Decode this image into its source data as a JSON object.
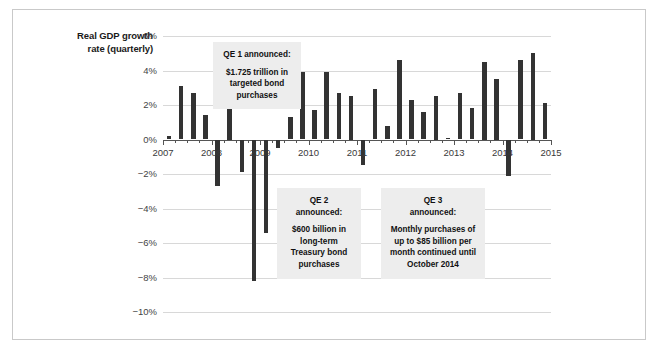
{
  "figure": {
    "axis_title_line1": "Real GDP growth",
    "axis_title_line2": "rate (quarterly)",
    "bar_color": "#333333",
    "callout_bg": "#ededed",
    "grid_color": "#d8d8d8",
    "zero_line_color": "#555555",
    "frame_color": "#c9c9c9"
  },
  "callouts": {
    "qe1": {
      "header": "QE 1 announced:",
      "body_line1": "$1.725 trillion in",
      "body_line2": "targeted bond",
      "body_line3": "purchases"
    },
    "qe2": {
      "header_line1": "QE 2",
      "header_line2": "announced:",
      "body_line1": "$600 billion in",
      "body_line2": "long-term",
      "body_line3": "Treasury bond",
      "body_line4": "purchases"
    },
    "qe3": {
      "header_line1": "QE 3",
      "header_line2": "announced:",
      "body_line1": "Monthly purchases of",
      "body_line2": "up to $85 billion per",
      "body_line3": "month continued until",
      "body_line4": "October 2014"
    }
  },
  "chart_data": {
    "type": "bar",
    "title": "",
    "xlabel": "",
    "ylabel": "Real GDP growth rate (quarterly)",
    "ylim": [
      -10,
      6
    ],
    "ytick_labels": [
      "6%",
      "4%",
      "2%",
      "0%",
      "−2%",
      "−4%",
      "−6%",
      "−8%",
      "−10%"
    ],
    "ytick_values": [
      6,
      4,
      2,
      0,
      -2,
      -4,
      -6,
      -8,
      -10
    ],
    "xtick_labels": [
      "2007",
      "2008",
      "2009",
      "2010",
      "2011",
      "2012",
      "2013",
      "2014",
      "2015"
    ],
    "xtick_values": [
      2007,
      2008,
      2009,
      2010,
      2011,
      2012,
      2013,
      2014,
      2015
    ],
    "grid": true,
    "legend": "none",
    "x": [
      "2007 Q1",
      "2007 Q2",
      "2007 Q3",
      "2007 Q4",
      "2008 Q1",
      "2008 Q2",
      "2008 Q3",
      "2008 Q4",
      "2009 Q1",
      "2009 Q2",
      "2009 Q3",
      "2009 Q4",
      "2010 Q1",
      "2010 Q2",
      "2010 Q3",
      "2010 Q4",
      "2011 Q1",
      "2011 Q2",
      "2011 Q3",
      "2011 Q4",
      "2012 Q1",
      "2012 Q2",
      "2012 Q3",
      "2012 Q4",
      "2013 Q1",
      "2013 Q2",
      "2013 Q3",
      "2013 Q4",
      "2014 Q1",
      "2014 Q2",
      "2014 Q3",
      "2014 Q4"
    ],
    "values": [
      0.2,
      3.1,
      2.7,
      1.4,
      -2.7,
      2.0,
      -1.9,
      -8.2,
      -5.4,
      -0.5,
      1.3,
      3.9,
      1.7,
      3.9,
      2.7,
      2.5,
      -1.5,
      2.9,
      0.8,
      4.6,
      2.3,
      1.6,
      2.5,
      0.1,
      2.7,
      1.8,
      4.5,
      3.5,
      -2.1,
      4.6,
      5.0,
      2.1
    ],
    "annotations": [
      "QE 1 announced: $1.725 trillion in targeted bond purchases",
      "QE 2 announced: $600 billion in long-term Treasury bond purchases",
      "QE 3 announced: Monthly purchases of up to $85 billion per month continued until October 2014"
    ]
  }
}
